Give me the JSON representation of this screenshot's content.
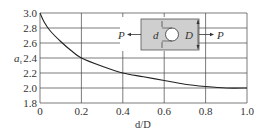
{
  "chart_data": {
    "type": "line",
    "title": "",
    "xlabel": "d/D",
    "ylabel": "a_t",
    "xlim": [
      0,
      1.0
    ],
    "ylim": [
      1.8,
      3.0
    ],
    "x_ticks": [
      "0",
      "0.2",
      "0.4",
      "0.6",
      "0.8",
      "1.0"
    ],
    "y_ticks": [
      "3.0",
      "2.8",
      "2.6",
      "2.4",
      "2.2",
      "2.0",
      "1.8"
    ],
    "grid": true,
    "series": [
      {
        "name": "stress concentration factor",
        "x": [
          0,
          0.02,
          0.05,
          0.1,
          0.15,
          0.2,
          0.3,
          0.4,
          0.5,
          0.6,
          0.7,
          0.8,
          0.9,
          1.0
        ],
        "y": [
          3.0,
          2.88,
          2.76,
          2.62,
          2.5,
          2.4,
          2.29,
          2.2,
          2.15,
          2.1,
          2.05,
          2.02,
          2.0,
          2.0
        ]
      }
    ],
    "inset": {
      "labels": {
        "load_left": "P",
        "load_right": "P",
        "hole_diameter": "d",
        "width": "D"
      },
      "plate_color": "#cfcfcf"
    }
  },
  "colors": {
    "line": "#222222",
    "grid": "#444444",
    "text": "#333333"
  }
}
